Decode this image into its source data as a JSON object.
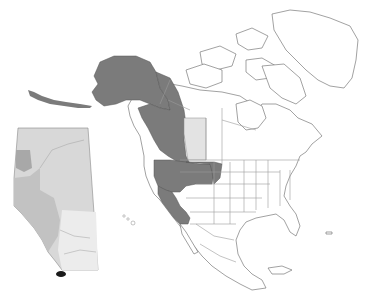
{
  "map": {
    "title": "",
    "type": "species range map",
    "region": "North America",
    "colors": {
      "background": "#ffffff",
      "range_present": "#7b7b7b",
      "range_alberta_light": "#e3e3e3",
      "land": "#ffffff",
      "borders": "#9a9a9a",
      "inset_light": "#d6d6d6",
      "inset_mid": "#b8b8b8",
      "inset_dark": "#9a9a9a",
      "inset_point": "#1a1a1a"
    },
    "highlighted_regions": [
      "Alaska",
      "Yukon",
      "British Columbia",
      "Washington",
      "Oregon",
      "California",
      "Idaho",
      "Montana",
      "Nevada (partial)"
    ],
    "light_regions": [
      "Alberta"
    ],
    "inset": {
      "name": "Alberta inset",
      "description": "Shaded Alberta province map with dark marker in southwest corner"
    }
  }
}
